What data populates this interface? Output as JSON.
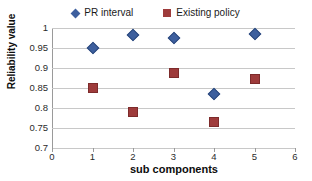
{
  "chart_data": {
    "type": "scatter",
    "title": "",
    "xlabel": "sub components",
    "ylabel": "Reliability value",
    "xlim": [
      0,
      6
    ],
    "ylim": [
      0.7,
      1
    ],
    "x_ticks": [
      "0",
      "1",
      "2",
      "3",
      "4",
      "5",
      "6"
    ],
    "y_ticks": [
      "0.7",
      "0.75",
      "0.8",
      "0.85",
      "0.9",
      "0.95",
      "1"
    ],
    "grid": "horizontal",
    "legend_position": "top-center",
    "x": [
      1,
      2,
      3,
      4,
      5
    ],
    "series": [
      {
        "name": "PR interval",
        "marker": "diamond",
        "color": "#3d5f9e",
        "values": [
          0.949,
          0.982,
          0.976,
          0.835,
          0.985
        ]
      },
      {
        "name": "Existing policy",
        "marker": "square",
        "color": "#9e3b3b",
        "values": [
          0.851,
          0.791,
          0.888,
          0.765,
          0.873
        ]
      }
    ]
  },
  "legend": {
    "items": [
      {
        "label": "PR interval"
      },
      {
        "label": "Existing policy"
      }
    ]
  },
  "axes": {
    "y_title": "Reliability value",
    "x_title": "sub components"
  },
  "colors": {
    "series_blue": "#3d5f9e",
    "series_red": "#9e3b3b",
    "gridline": "#c8c8c8",
    "axis": "#9a9a9a"
  }
}
